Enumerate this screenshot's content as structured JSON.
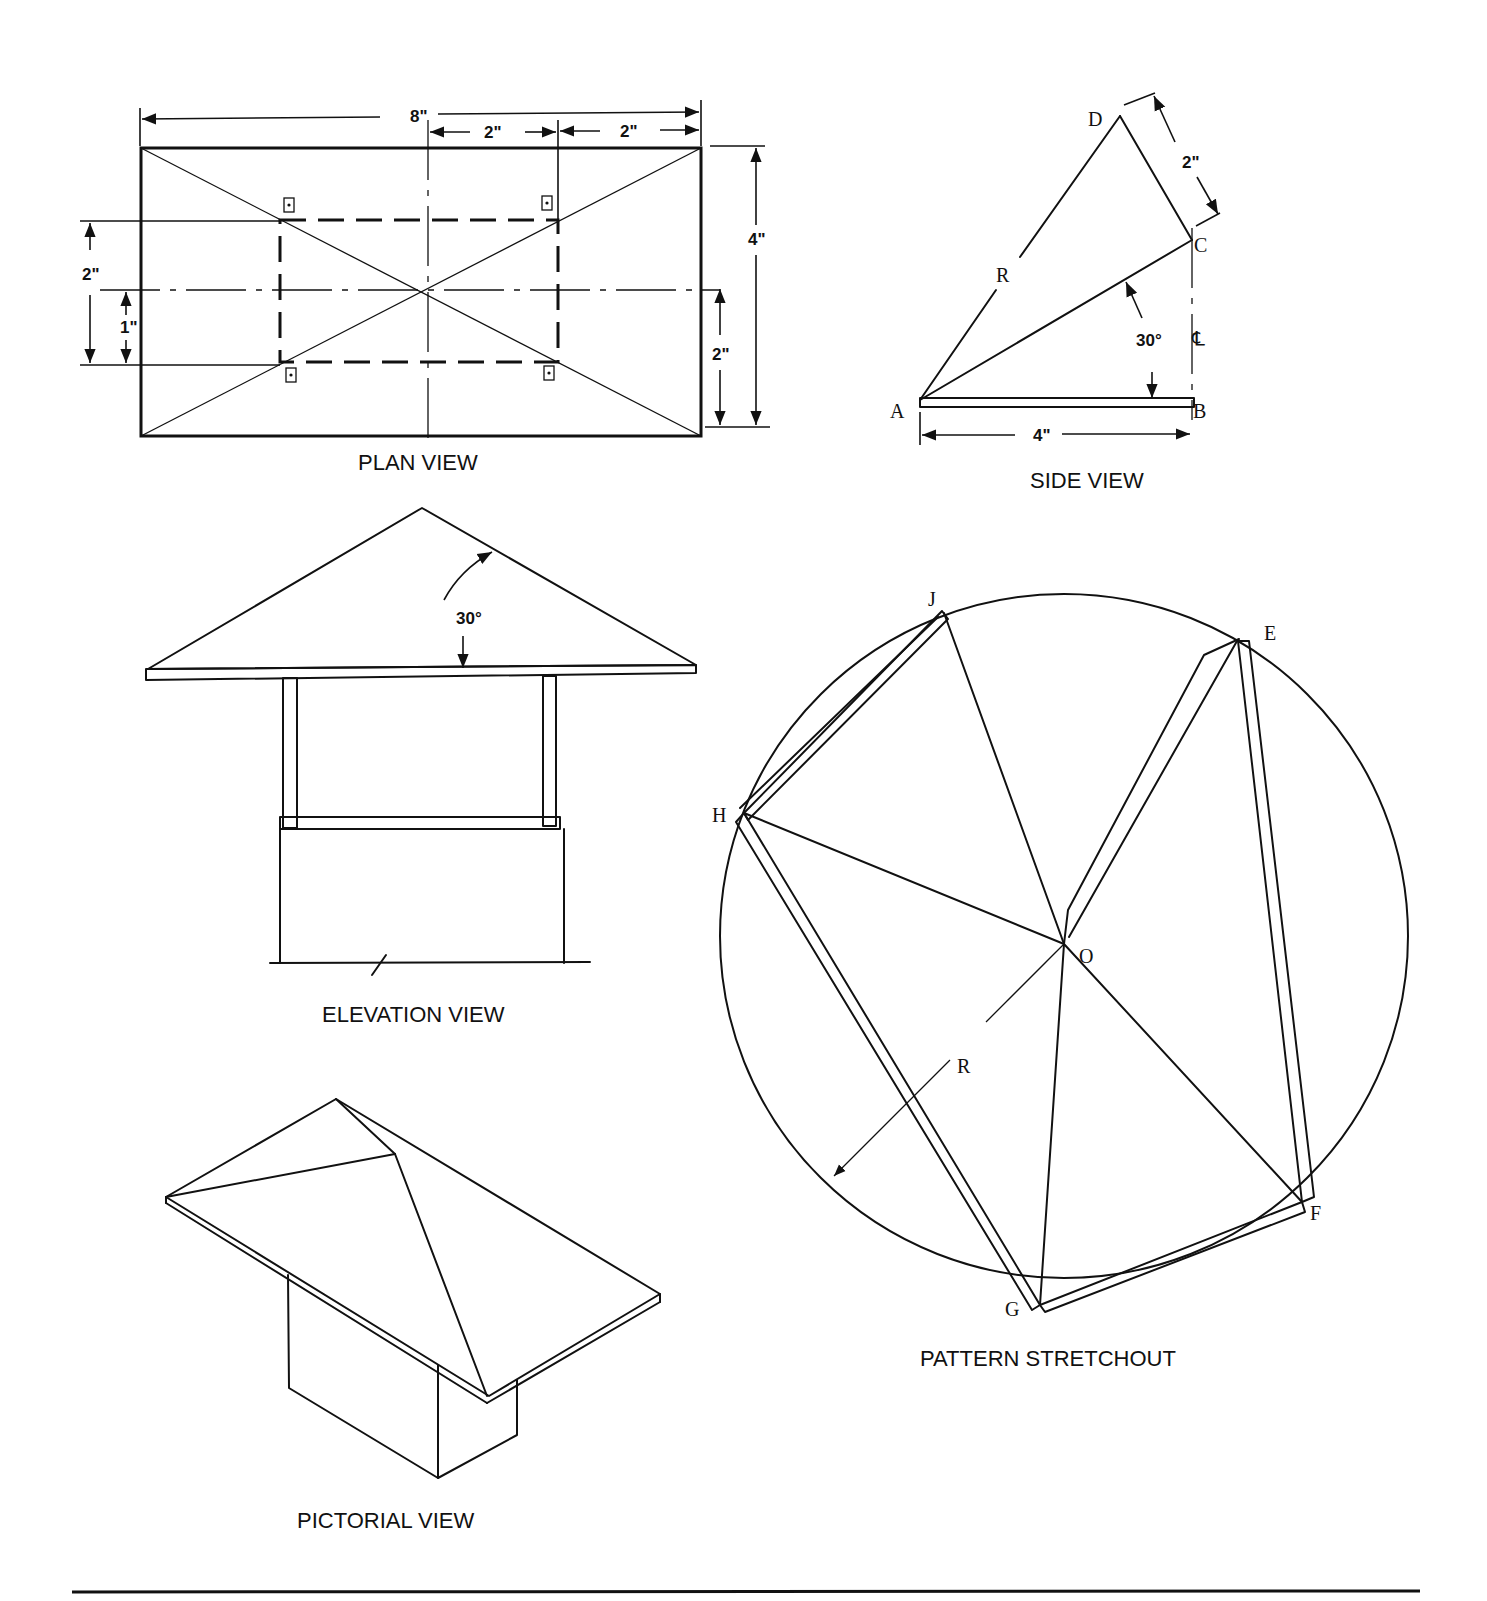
{
  "views": {
    "plan": {
      "caption": "PLAN VIEW",
      "dims": {
        "overall_width": "8\"",
        "inner_half": "2\"",
        "outer_offset": "2\"",
        "height": "4\"",
        "left_inner": "2\"",
        "left_offset": "1\"",
        "right_half": "2\""
      }
    },
    "side": {
      "caption": "SIDE VIEW",
      "points": {
        "A": "A",
        "B": "B",
        "C": "C",
        "D": "D",
        "R": "R",
        "CL": "℄"
      },
      "dims": {
        "base": "4\"",
        "slant": "2\"",
        "angle": "30°"
      }
    },
    "elevation": {
      "caption": "ELEVATION VIEW",
      "dims": {
        "angle": "30°"
      }
    },
    "pattern": {
      "caption": "PATTERN STRETCHOUT",
      "points": {
        "J": "J",
        "E": "E",
        "H": "H",
        "O": "O",
        "R": "R",
        "F": "F",
        "G": "G"
      }
    },
    "pictorial": {
      "caption": "PICTORIAL VIEW"
    }
  }
}
